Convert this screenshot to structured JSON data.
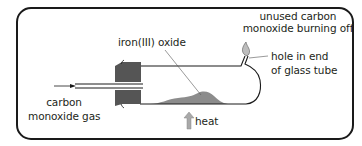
{
  "diagram": {
    "type": "apparatus",
    "colors": {
      "frame": "#1a1a1a",
      "stopper": "#555555",
      "iron_oxide": "#8c8c8c",
      "heat_arrow": "#a9a9a9",
      "text": "#231f20"
    },
    "labels": {
      "iron_oxide": "iron(III) oxide",
      "burning_line1": "unused carbon",
      "burning_line2": "monoxide burning off",
      "hole_line1": "hole in end",
      "hole_line2": "of glass tube",
      "gas_line1": "carbon",
      "gas_line2": "monoxide gas",
      "heat": "heat"
    },
    "icons": [
      "flame-icon",
      "gas-flow-arrow-icon",
      "heat-arrow-icon"
    ]
  }
}
